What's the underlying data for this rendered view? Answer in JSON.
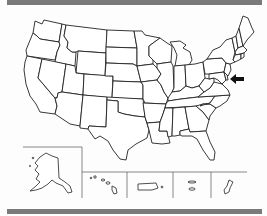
{
  "map": {
    "title": "",
    "type": "outline-map",
    "region": "United States",
    "highlight": {
      "indicator": "arrow-pointing-left",
      "target": "Maryland / Delaware area",
      "color": "#111111"
    },
    "insets": [
      {
        "name": "Alaska"
      },
      {
        "name": "Hawaii"
      },
      {
        "name": "Puerto Rico"
      },
      {
        "name": "U.S. Virgin Islands"
      },
      {
        "name": "Guam"
      }
    ],
    "colors": {
      "border_bars": "#7a7a7a",
      "state_fill": "#ffffff",
      "state_stroke": "#222222",
      "background": "#fdfdfd"
    }
  }
}
